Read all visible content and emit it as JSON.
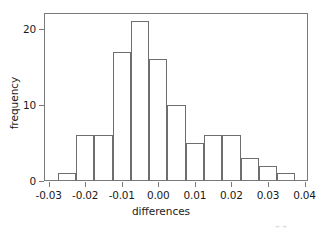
{
  "chart_data": {
    "type": "bar",
    "title": "",
    "xlabel": "differences",
    "ylabel": "frequency",
    "xlim": [
      -0.0325,
      0.0405
    ],
    "ylim": [
      0,
      22.5
    ],
    "xticks": [
      -0.03,
      -0.02,
      -0.01,
      0.0,
      0.01,
      0.02,
      0.03,
      0.04
    ],
    "xtick_labels": [
      "-0.03",
      "-0.02",
      "-0.01",
      "0.00",
      "0.01",
      "0.02",
      "0.03",
      "0.04"
    ],
    "yticks": [
      0,
      10,
      20
    ],
    "ytick_labels": [
      "0",
      "10",
      "20"
    ],
    "grid": false,
    "legend": null,
    "bin_width": 0.005,
    "bin_edges": [
      -0.0275,
      -0.0225,
      -0.0175,
      -0.0125,
      -0.0075,
      -0.0025,
      0.0025,
      0.0075,
      0.0125,
      0.0175,
      0.0225,
      0.0275,
      0.0325,
      0.0375
    ],
    "bin_centers": [
      -0.025,
      -0.02,
      -0.015,
      -0.01,
      -0.005,
      0.0,
      0.005,
      0.01,
      0.015,
      0.02,
      0.025,
      0.03,
      0.035
    ],
    "values": [
      1,
      6,
      6,
      17,
      21,
      16,
      10,
      5,
      6,
      6,
      3,
      2,
      1
    ],
    "categories": [
      "-0.0275 to -0.0225",
      "-0.0225 to -0.0175",
      "-0.0175 to -0.0125",
      "-0.0125 to -0.0075",
      "-0.0075 to -0.0025",
      "-0.0025 to 0.0025",
      "0.0025 to 0.0075",
      "0.0075 to 0.0125",
      "0.0125 to 0.0175",
      "0.0175 to 0.0225",
      "0.0225 to 0.0275",
      "0.0275 to 0.0325",
      "0.0325 to 0.0375"
    ],
    "bar_color": "#ffffff",
    "bar_edge_color": "#6e6e6e",
    "total_count": 100
  },
  "figure": {
    "background": "#ffffff",
    "frame_color": "#7a7a7a",
    "text_color": "#1a1a1a"
  }
}
